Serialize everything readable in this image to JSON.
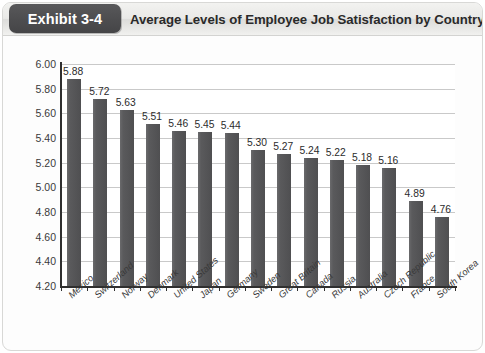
{
  "exhibit": {
    "badge_label": "Exhibit 3-4",
    "title": "Average Levels of Employee Job Satisfaction by Country"
  },
  "colors": {
    "bar": "#58585a",
    "badge_bg": "#4d4d4f",
    "header_bg": "#e9e9e7",
    "gridline": "#c9c9c9",
    "axis": "#2f2f2f",
    "text": "#2a2a2a"
  },
  "chart_data": {
    "type": "bar",
    "title": "Average Levels of Employee Job Satisfaction by Country",
    "xlabel": "",
    "ylabel": "",
    "ylim": [
      4.2,
      6.0
    ],
    "ytick_labels": [
      "6.00",
      "5.80",
      "5.60",
      "5.40",
      "5.20",
      "5.00",
      "4.80",
      "4.60",
      "4.40",
      "4.20"
    ],
    "yticks": [
      6.0,
      5.8,
      5.6,
      5.4,
      5.2,
      5.0,
      4.8,
      4.6,
      4.4,
      4.2
    ],
    "grid": true,
    "legend": false,
    "categories": [
      "Mexico",
      "Switzerland",
      "Norway",
      "Denmark",
      "United States",
      "Japan",
      "Germany",
      "Sweden",
      "Great Britain",
      "Canada",
      "Russia",
      "Australia",
      "Czech Republic",
      "France",
      "South Korea"
    ],
    "values": [
      5.88,
      5.72,
      5.63,
      5.51,
      5.46,
      5.45,
      5.44,
      5.3,
      5.27,
      5.24,
      5.22,
      5.18,
      5.16,
      4.89,
      4.76
    ],
    "value_labels": [
      "5.88",
      "5.72",
      "5.63",
      "5.51",
      "5.46",
      "5.45",
      "5.44",
      "5.30",
      "5.27",
      "5.24",
      "5.22",
      "5.18",
      "5.16",
      "4.89",
      "4.76"
    ]
  }
}
